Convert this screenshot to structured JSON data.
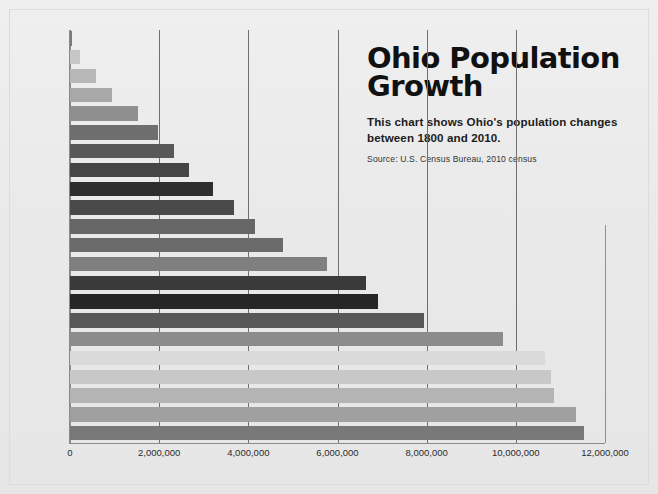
{
  "header": {
    "title": "Ohio Population\nGrowth",
    "subtitle": "This chart shows Ohio's population changes\nbetween 1800 and 2010.",
    "source": "Source: U.S. Census Bureau, 2010 census"
  },
  "chart_data": {
    "type": "bar",
    "orientation": "horizontal",
    "title": "Ohio Population Growth",
    "subtitle": "This chart shows Ohio's population changes between 1800 and 2010.",
    "source": "Source: U.S. Census Bureau, 2010 census",
    "xlabel": "",
    "ylabel": "",
    "xlim": [
      0,
      12000000
    ],
    "xticks": [
      0,
      2000000,
      4000000,
      6000000,
      8000000,
      10000000,
      12000000
    ],
    "xticklabels": [
      "0",
      "2,000,000",
      "4,000,000",
      "6,000,000",
      "8,000,000",
      "10,000,000",
      "12,000,000"
    ],
    "grid": "vertical",
    "legend": "none",
    "categories": [
      "1800",
      "1810",
      "1820",
      "1830",
      "1840",
      "1850",
      "1860",
      "1870",
      "1880",
      "1890",
      "1900",
      "1910",
      "1920",
      "1930",
      "1940",
      "1950",
      "1960",
      "1970",
      "1980",
      "1990",
      "2000",
      "2010"
    ],
    "values": [
      45365,
      230760,
      581434,
      937903,
      1519467,
      1980329,
      2339511,
      2665260,
      3198062,
      3672329,
      4157545,
      4767121,
      5759394,
      6646697,
      6907612,
      7946627,
      9706397,
      10652017,
      10797630,
      10847115,
      11353140,
      11536504
    ],
    "bar_colors": [
      "#7b7b7b",
      "#c6c6c6",
      "#b7b7b7",
      "#a8a8a8",
      "#8f8f8f",
      "#6e6e6e",
      "#585858",
      "#454545",
      "#2e2e2e",
      "#4a4a4a",
      "#666666",
      "#6b6b6b",
      "#7f7f7f",
      "#3a3a3a",
      "#262626",
      "#575757",
      "#8c8c8c",
      "#dadada",
      "#c8c8c8",
      "#b4b4b4",
      "#a0a0a0",
      "#787878"
    ]
  },
  "axis": {
    "y_ticklabels": [
      "1800",
      "1810",
      "1820",
      "1830",
      "1840",
      "1850",
      "1860",
      "1870",
      "1880",
      "1890",
      "1900",
      "1910",
      "1920",
      "1930",
      "1940",
      "1950",
      "1960",
      "1970",
      "1980",
      "1990",
      "2000",
      "2010"
    ]
  }
}
